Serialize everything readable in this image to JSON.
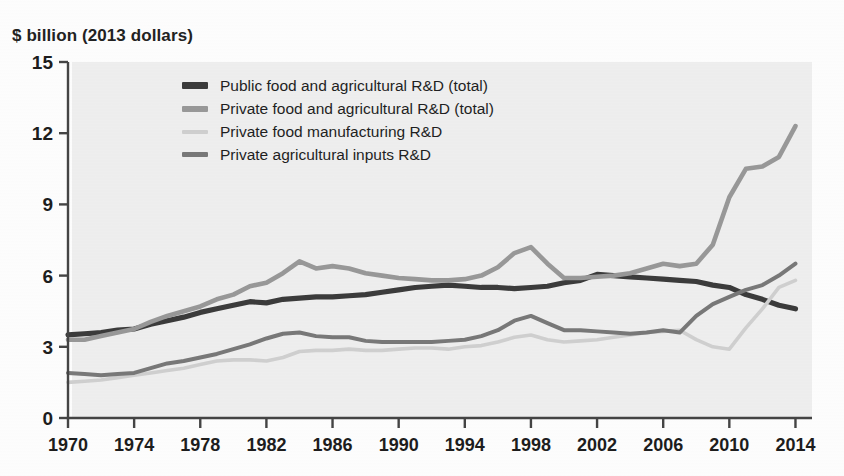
{
  "axis": {
    "ylabel": "$ billion (2013 dollars)",
    "yticks": [
      0,
      3,
      6,
      9,
      12,
      15
    ],
    "ylim": [
      0,
      15
    ],
    "xticks": [
      1970,
      1974,
      1978,
      1982,
      1986,
      1990,
      1994,
      1998,
      2002,
      2006,
      2010,
      2014
    ],
    "xlim": [
      1970,
      2015
    ]
  },
  "colors": {
    "public_total": "#3b3b3b",
    "private_total": "#989898",
    "private_food_mfg": "#cfcfcf",
    "private_ag_inputs": "#787878",
    "plot_background": "#eeeeee",
    "axis_line": "#444444",
    "text": "#1d1d1d"
  },
  "legend": {
    "items": [
      {
        "label": "Public food and agricultural R&D (total)",
        "color_key": "public_total",
        "swatch": "s0"
      },
      {
        "label": "Private food and agricultural R&D (total)",
        "color_key": "private_total",
        "swatch": "s1"
      },
      {
        "label": "Private food manufacturing R&D",
        "color_key": "private_food_mfg",
        "swatch": "s2"
      },
      {
        "label": "Private agricultural inputs R&D",
        "color_key": "private_ag_inputs",
        "swatch": "s3"
      }
    ]
  },
  "chart_data": {
    "type": "line",
    "title": "",
    "subtitle": "",
    "xlabel": "",
    "ylabel": "$ billion (2013 dollars)",
    "xlim": [
      1970,
      2015
    ],
    "ylim": [
      0,
      15
    ],
    "grid": false,
    "legend_position": "top-center-inside",
    "x": [
      1970,
      1971,
      1972,
      1973,
      1974,
      1975,
      1976,
      1977,
      1978,
      1979,
      1980,
      1981,
      1982,
      1983,
      1984,
      1985,
      1986,
      1987,
      1988,
      1989,
      1990,
      1991,
      1992,
      1993,
      1994,
      1995,
      1996,
      1997,
      1998,
      1999,
      2000,
      2001,
      2002,
      2003,
      2004,
      2005,
      2006,
      2007,
      2008,
      2009,
      2010,
      2011,
      2012,
      2013,
      2014
    ],
    "series": [
      {
        "name": "Public food and agricultural R&D (total)",
        "color": "#3b3b3b",
        "values": [
          3.5,
          3.55,
          3.6,
          3.7,
          3.75,
          3.95,
          4.1,
          4.25,
          4.45,
          4.6,
          4.75,
          4.9,
          4.85,
          5.0,
          5.05,
          5.1,
          5.1,
          5.15,
          5.2,
          5.3,
          5.4,
          5.5,
          5.55,
          5.6,
          5.55,
          5.5,
          5.5,
          5.45,
          5.5,
          5.55,
          5.7,
          5.8,
          6.05,
          6.0,
          5.95,
          5.9,
          5.85,
          5.8,
          5.75,
          5.6,
          5.5,
          5.2,
          5.0,
          4.75,
          4.6
        ]
      },
      {
        "name": "Private food and agricultural R&D (total)",
        "color": "#989898",
        "values": [
          3.3,
          3.3,
          3.45,
          3.6,
          3.75,
          4.05,
          4.3,
          4.5,
          4.7,
          5.0,
          5.2,
          5.55,
          5.7,
          6.1,
          6.6,
          6.3,
          6.4,
          6.3,
          6.1,
          6.0,
          5.9,
          5.85,
          5.8,
          5.8,
          5.85,
          6.0,
          6.35,
          6.95,
          7.2,
          6.5,
          5.9,
          5.9,
          5.95,
          6.0,
          6.1,
          6.3,
          6.5,
          6.4,
          6.5,
          7.3,
          9.3,
          10.5,
          10.6,
          11.0,
          12.3
        ]
      },
      {
        "name": "Private food manufacturing R&D",
        "color": "#cfcfcf",
        "values": [
          1.5,
          1.55,
          1.6,
          1.7,
          1.8,
          1.9,
          2.0,
          2.1,
          2.25,
          2.4,
          2.45,
          2.45,
          2.4,
          2.55,
          2.8,
          2.85,
          2.85,
          2.9,
          2.85,
          2.85,
          2.9,
          2.95,
          2.95,
          2.9,
          3.0,
          3.05,
          3.2,
          3.4,
          3.5,
          3.3,
          3.2,
          3.25,
          3.3,
          3.4,
          3.5,
          3.6,
          3.65,
          3.7,
          3.3,
          3.0,
          2.9,
          3.8,
          4.6,
          5.5,
          5.8
        ]
      },
      {
        "name": "Private agricultural inputs R&D",
        "color": "#787878",
        "values": [
          1.9,
          1.85,
          1.8,
          1.85,
          1.9,
          2.1,
          2.3,
          2.4,
          2.55,
          2.7,
          2.9,
          3.1,
          3.35,
          3.55,
          3.6,
          3.45,
          3.4,
          3.4,
          3.25,
          3.2,
          3.2,
          3.2,
          3.2,
          3.25,
          3.3,
          3.45,
          3.7,
          4.1,
          4.3,
          4.0,
          3.7,
          3.7,
          3.65,
          3.6,
          3.55,
          3.6,
          3.7,
          3.6,
          4.3,
          4.8,
          5.1,
          5.4,
          5.6,
          6.0,
          6.5
        ]
      }
    ]
  }
}
